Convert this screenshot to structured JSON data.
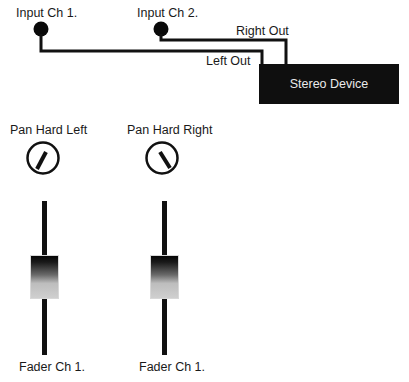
{
  "inputs": {
    "ch1_label": "Input Ch 1.",
    "ch2_label": "Input Ch 2."
  },
  "outputs": {
    "left_label": "Left Out",
    "right_label": "Right Out"
  },
  "device": {
    "label": "Stereo Device"
  },
  "knobs": [
    {
      "label": "Pan Hard Left",
      "position": "hard-left"
    },
    {
      "label": "Pan Hard Right",
      "position": "hard-right"
    }
  ],
  "faders": [
    {
      "label": "Fader Ch 1."
    },
    {
      "label": "Fader Ch 1."
    }
  ],
  "colors": {
    "line": "#111111",
    "device_bg": "#0f0f0f",
    "device_text": "#eaeaea"
  }
}
